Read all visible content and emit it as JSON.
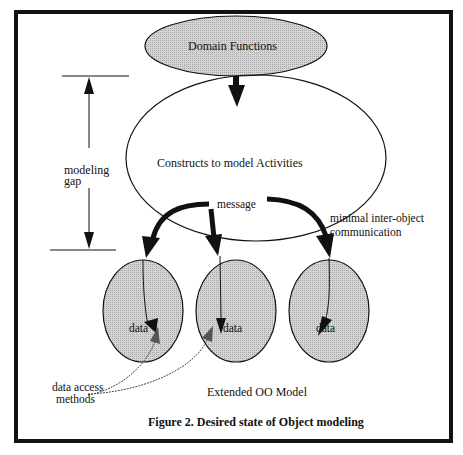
{
  "figure": {
    "caption": "Figure 2. Desired state of Object modeling",
    "model_label": "Extended OO Model"
  },
  "nodes": {
    "domain_functions": "Domain Functions",
    "activities": "Constructs to model Activities",
    "objects": [
      {
        "label": "data"
      },
      {
        "label": "data"
      },
      {
        "label": "data"
      }
    ]
  },
  "annotations": {
    "gap_line1": "modeling",
    "gap_line2": "gap",
    "message": "message",
    "comm_line1": "minimal inter-object",
    "comm_line2": "communication",
    "access_line1": "data access",
    "access_line2": "methods"
  },
  "colors": {
    "frame": "#111111",
    "shaded_fill": "#c8c8c8",
    "stroke": "#111111"
  }
}
